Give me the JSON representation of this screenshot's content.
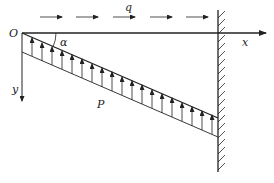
{
  "diagram": {
    "labels": {
      "origin": "O",
      "angle": "α",
      "x_axis": "x",
      "y_axis": "y",
      "horizontal_load": "q",
      "pressure": "P"
    },
    "colors": {
      "line": "#222222",
      "background": "#ffffff"
    },
    "elements": {
      "horizontal_load_arrows": 5,
      "pressure_arrows": 17,
      "support": "fixed wall with hatching"
    }
  }
}
